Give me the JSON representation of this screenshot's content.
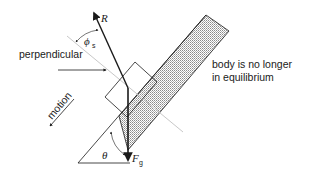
{
  "diagram": {
    "type": "inclined-plane-force-diagram",
    "labels": {
      "resultant": "R",
      "angle_between": "ϕ",
      "angle_between_sub": "s",
      "perpendicular": "perpendicular",
      "motion": "motion",
      "incline_angle": "θ",
      "gravity": "F",
      "gravity_sub": "g",
      "annotation_line1": "body is no longer",
      "annotation_line2": "in equilibrium"
    },
    "colors": {
      "line": "#1a1a1a",
      "perpendicular_line": "#c8c8c8",
      "hatch_fill": "#bdbdbd",
      "background": "#ffffff"
    }
  }
}
